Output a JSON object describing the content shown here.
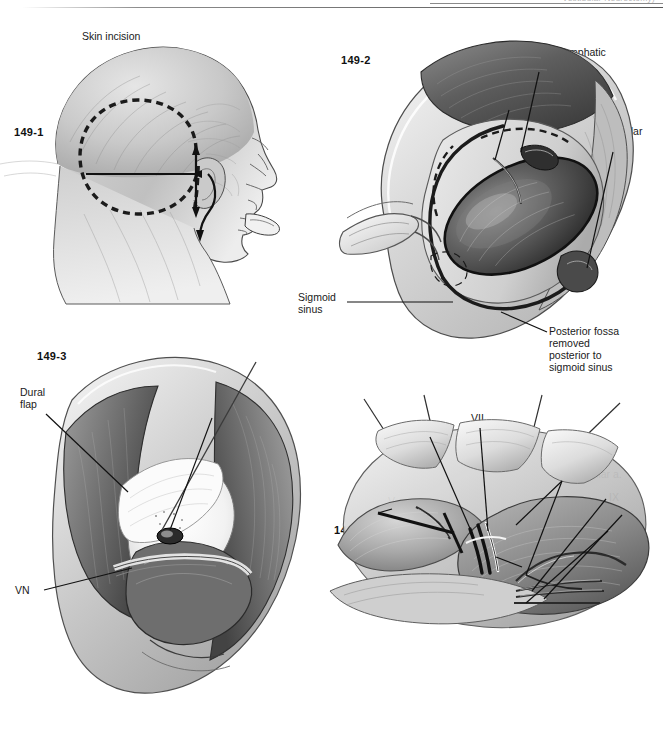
{
  "page": {
    "running_head": "Vestibular Neurectomy)",
    "page_number": "149",
    "background": "#ffffff",
    "ink_color": "#1b1b1b"
  },
  "figures": [
    {
      "id": "149-1",
      "number": "149-1",
      "caption_labels": [
        "Skin incision"
      ]
    },
    {
      "id": "149-2",
      "number": "149-2",
      "caption_labels": [
        "Endolymphatic sac",
        "VII",
        "Jugular bulb",
        "Sigmoid sinus",
        "Posterior fossa removed posterior to sigmoid sinus"
      ]
    },
    {
      "id": "149-3",
      "number": "149-3",
      "caption_labels": [
        "Dural flap",
        "Endolymphatic sac",
        "VN"
      ]
    },
    {
      "id": "149-4",
      "number": "149-4",
      "caption_labels": [
        "VIII",
        "VII",
        "V",
        "Anterior inferior cerebellar a.",
        "IX",
        "X",
        "XI",
        "Branch of inferior cerebellar a."
      ]
    }
  ],
  "fig1": {
    "number": "149-1",
    "skin_incision": "Skin incision"
  },
  "fig2": {
    "number": "149-2",
    "endolymphatic_sac_l1": "Endolymphatic",
    "endolymphatic_sac_l2": "sac",
    "vii": "VII",
    "jugular_l1": "Jugular",
    "jugular_l2": "bulb",
    "sigmoid_l1": "Sigmoid",
    "sigmoid_l2": "sinus",
    "posterior_fossa_l1": "Posterior fossa",
    "posterior_fossa_l2": "removed",
    "posterior_fossa_l3": "posterior to",
    "posterior_fossa_l4": "sigmoid sinus"
  },
  "fig3": {
    "number": "149-3",
    "dural_l1": "Dural",
    "dural_l2": "flap",
    "endo_l1": "Endolymphatic",
    "endo_l2": "sac",
    "vn": "VN"
  },
  "fig4": {
    "number": "149-4",
    "viii": "VIII",
    "vii": "VII",
    "v": "V",
    "aica_l1": "Anterior",
    "aica_l2": "inferior",
    "aica_l3": "cerebellar a.",
    "ix": "IX",
    "x": "X",
    "xi": "XI",
    "branch_l1": "Branch of",
    "branch_l2": "inferior cerebellar a."
  }
}
